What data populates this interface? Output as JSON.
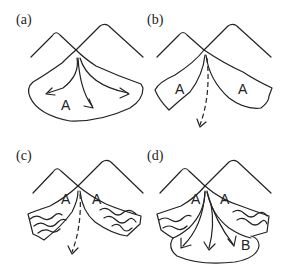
{
  "figure": {
    "panels": [
      {
        "id": "a",
        "label": "(a)",
        "fan_labels": [
          "A"
        ],
        "description": "Single active fan lobe with three diverging flow arrows from apex"
      },
      {
        "id": "b",
        "label": "(b)",
        "fan_labels": [
          "A",
          "A"
        ],
        "description": "Fan incised by channel; dashed arrow shows flow through incised channel"
      },
      {
        "id": "c",
        "label": "(c)",
        "fan_labels": [
          "A",
          "A"
        ],
        "description": "Abandoned fan surfaces with wavy weathering lines; dashed arrow through incised channel"
      },
      {
        "id": "d",
        "label": "(d)",
        "fan_labels": [
          "A",
          "A",
          "B"
        ],
        "description": "New fan lobe B deposited below older abandoned A surfaces with three flow arrows"
      }
    ]
  },
  "colors": {
    "line": "#222222",
    "background": "#ffffff"
  }
}
